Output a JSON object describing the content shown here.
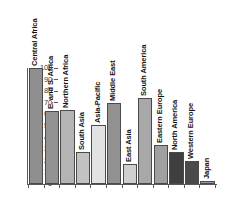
{
  "chart_data": {
    "type": "bar",
    "title": "",
    "xlabel": "",
    "ylabel": "",
    "ylim": [
      0,
      100
    ],
    "yticks": [
      0,
      10,
      20,
      30,
      40,
      50,
      60,
      70,
      80,
      90,
      100
    ],
    "grid": false,
    "legend": "none",
    "categories": [
      "Central Africa",
      "E. and S. Africa",
      "Northern Africa",
      "South Asia",
      "Asia-Pacific",
      "Middle East",
      "East Asia",
      "South America",
      "Eastern Europe",
      "North America",
      "Western Europe",
      "Japan"
    ],
    "values": [
      100,
      63,
      64,
      28,
      51,
      70,
      17,
      74,
      34,
      28,
      20,
      3
    ],
    "colors": [
      "#8f8f8f",
      "#939393",
      "#b4b4b4",
      "#c2c2c2",
      "#e2e2e2",
      "#919191",
      "#cfcfcf",
      "#a8a8a8",
      "#a0a0a0",
      "#3f3f3f",
      "#4a4a4a",
      "#9a9a9a"
    ]
  },
  "axis": {
    "tick_labels": [
      "0",
      "10",
      "20",
      "30",
      "40",
      "50",
      "60",
      "70",
      "80",
      "90",
      "100"
    ]
  }
}
